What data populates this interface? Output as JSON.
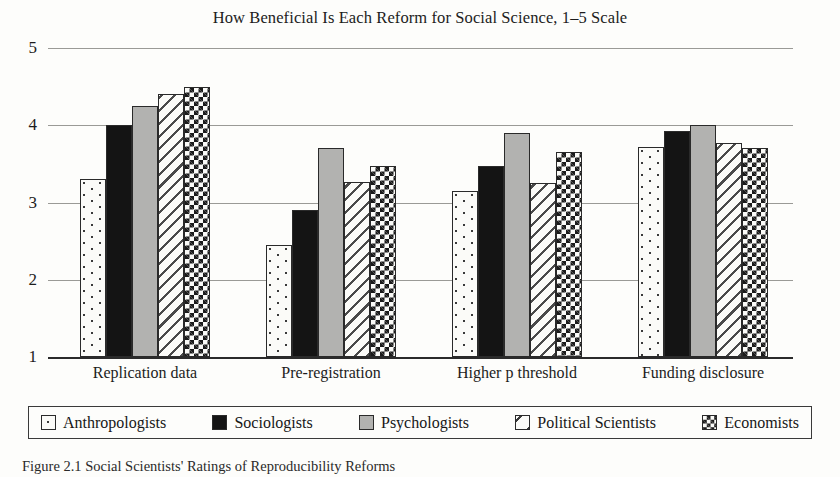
{
  "figure": {
    "caption": "Figure 2.1 Social Scientists' Ratings of Reproducibility Reforms"
  },
  "chart_data": {
    "type": "bar",
    "title": "How Beneficial Is Each Reform for Social Science, 1–5 Scale",
    "xlabel": "",
    "ylabel": "",
    "ylim": [
      1,
      5
    ],
    "yticks": [
      1,
      2,
      3,
      4,
      5
    ],
    "ytick_labels": [
      "1",
      "2",
      "3",
      "4",
      "5"
    ],
    "grid": true,
    "legend_position": "bottom",
    "categories": [
      "Replication data",
      "Pre-registration",
      "Higher p threshold",
      "Funding disclosure"
    ],
    "series": [
      {
        "name": "Anthropologists",
        "pattern": "dotted",
        "values": [
          3.3,
          2.45,
          3.15,
          3.72
        ]
      },
      {
        "name": "Sociologists",
        "pattern": "solid-black",
        "values": [
          4.0,
          2.9,
          3.47,
          3.92
        ]
      },
      {
        "name": "Psychologists",
        "pattern": "solid-gray",
        "values": [
          4.25,
          3.7,
          3.9,
          4.0
        ]
      },
      {
        "name": "Political Scientists",
        "pattern": "diagonal-stripes",
        "values": [
          4.4,
          3.27,
          3.25,
          3.77
        ]
      },
      {
        "name": "Economists",
        "pattern": "checkerboard",
        "values": [
          4.5,
          3.47,
          3.65,
          3.7
        ]
      }
    ],
    "colors": {
      "bar_outline": "#2a2a2a",
      "solid_black": "#141414",
      "solid_gray": "#b2b2b0",
      "background": "#fdfdfb",
      "gridline": "#9a9a96",
      "axis": "#2b2b2b"
    }
  }
}
